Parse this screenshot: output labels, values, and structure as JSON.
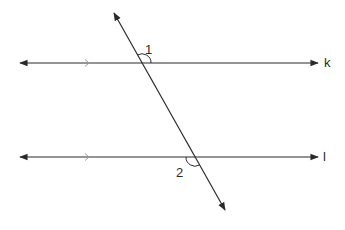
{
  "diagram": {
    "type": "parallel-lines-cut-by-transversal",
    "lines": [
      {
        "name": "k",
        "label": "k",
        "y": 63,
        "x1": 20,
        "x2": 318,
        "parallel_mark": ">"
      },
      {
        "name": "l",
        "label": "l",
        "y": 157,
        "x1": 20,
        "x2": 318,
        "parallel_mark": ">"
      }
    ],
    "transversal": {
      "x1": 114,
      "y1": 13,
      "x2": 225,
      "y2": 210
    },
    "angles": [
      {
        "label": "1",
        "at_line": "k",
        "position": "above-right"
      },
      {
        "label": "2",
        "at_line": "l",
        "position": "below-left"
      }
    ],
    "colors": {
      "stroke": "#2a2a2a",
      "mark": "#9a9a9a",
      "background": "#ffffff"
    }
  }
}
